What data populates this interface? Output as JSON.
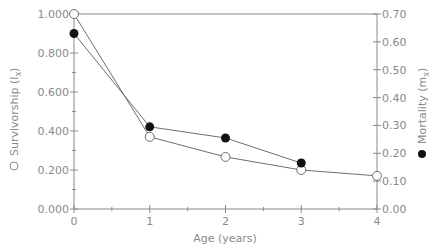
{
  "chart_data": {
    "type": "line",
    "title": "",
    "xlabel": "Age (years)",
    "ylabel_left": "Survivorship (l",
    "ylabel_left_sub": "x",
    "ylabel_right": "Mortality (m",
    "ylabel_right_sub": "x",
    "x": [
      0,
      1,
      2,
      3,
      4
    ],
    "x_ticks": [
      "0",
      "1",
      "2",
      "3",
      "4"
    ],
    "xlim": [
      0,
      4
    ],
    "ylim_left": [
      0,
      1.0
    ],
    "ylim_right": [
      0,
      0.7
    ],
    "y_left_ticks": [
      "0.000",
      "0.200",
      "0.400",
      "0.600",
      "0.800",
      "1.000"
    ],
    "y_right_ticks": [
      "0.00",
      "0.10",
      "0.20",
      "0.30",
      "0.40",
      "0.50",
      "0.60",
      "0.70"
    ],
    "grid": false,
    "series": [
      {
        "name": "Survivorship (lx)",
        "axis": "left",
        "marker": "open-circle",
        "x": [
          0,
          1,
          2,
          3,
          4
        ],
        "values": [
          1.0,
          0.37,
          0.267,
          0.2,
          0.17
        ]
      },
      {
        "name": "Mortality (mx)",
        "axis": "right",
        "marker": "filled-circle",
        "x": [
          0,
          1,
          2,
          3
        ],
        "values": [
          0.63,
          0.295,
          0.255,
          0.165
        ]
      }
    ],
    "legend": "markers beside rotated axis labels"
  }
}
